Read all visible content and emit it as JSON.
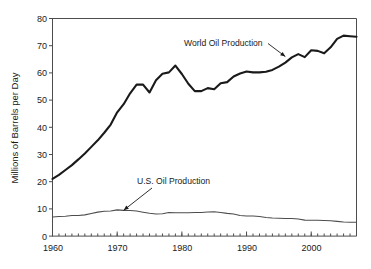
{
  "chart_data": {
    "type": "line",
    "title": "",
    "xlabel": "",
    "ylabel": "Millions of Barrels per Day",
    "xlim": [
      1960,
      2007
    ],
    "ylim": [
      0,
      80
    ],
    "grid": false,
    "legend_position": "inline-annotations",
    "x_ticks_major": [
      1960,
      1970,
      1980,
      1990,
      2000
    ],
    "x_tick_labels": [
      "1960",
      "1970",
      "1980",
      "1990",
      "2000"
    ],
    "x_minor_tick_step": 1,
    "y_ticks": [
      0,
      10,
      20,
      30,
      40,
      50,
      60,
      70,
      80
    ],
    "y_tick_labels": [
      "0",
      "10",
      "20",
      "30",
      "40",
      "50",
      "60",
      "70",
      "80"
    ],
    "x": [
      1960,
      1961,
      1962,
      1963,
      1964,
      1965,
      1966,
      1967,
      1968,
      1969,
      1970,
      1971,
      1972,
      1973,
      1974,
      1975,
      1976,
      1977,
      1978,
      1979,
      1980,
      1981,
      1982,
      1983,
      1984,
      1985,
      1986,
      1987,
      1988,
      1989,
      1990,
      1991,
      1992,
      1993,
      1994,
      1995,
      1996,
      1997,
      1998,
      1999,
      2000,
      2001,
      2002,
      2003,
      2004,
      2005,
      2006,
      2007
    ],
    "series": [
      {
        "name": "World Oil Production",
        "color": "#1a1a1a",
        "values": [
          21.0,
          22.5,
          24.3,
          26.1,
          28.2,
          30.4,
          32.8,
          35.2,
          38.0,
          41.0,
          45.5,
          48.5,
          52.5,
          55.7,
          55.7,
          52.8,
          57.3,
          59.7,
          60.2,
          62.7,
          59.6,
          56.0,
          53.3,
          53.3,
          54.4,
          54.0,
          56.2,
          56.6,
          58.7,
          59.8,
          60.5,
          60.2,
          60.2,
          60.4,
          61.1,
          62.3,
          63.8,
          65.7,
          66.9,
          65.8,
          68.3,
          68.1,
          67.2,
          69.4,
          72.5,
          73.7,
          73.5,
          73.3
        ]
      },
      {
        "name": "U.S. Oil Production",
        "color": "#4d4d4d",
        "values": [
          7.05,
          7.18,
          7.33,
          7.54,
          7.61,
          7.8,
          8.3,
          8.81,
          9.1,
          9.24,
          9.64,
          9.46,
          9.44,
          9.21,
          8.77,
          8.38,
          8.13,
          8.25,
          8.71,
          8.55,
          8.6,
          8.57,
          8.65,
          8.69,
          8.88,
          8.97,
          8.68,
          8.35,
          8.14,
          7.61,
          7.36,
          7.42,
          7.17,
          6.85,
          6.66,
          6.56,
          6.47,
          6.45,
          6.25,
          5.88,
          5.82,
          5.8,
          5.75,
          5.68,
          5.42,
          5.18,
          5.1,
          5.1
        ]
      }
    ],
    "annotations": [
      {
        "text": "World Oil Production",
        "target_year": 1996,
        "target_value": 66.0
      },
      {
        "text": "U.S. Oil Production",
        "target_year": 1971,
        "target_value": 9.5
      }
    ]
  }
}
